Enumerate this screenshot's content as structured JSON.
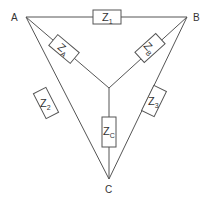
{
  "diagram": {
    "title": "",
    "type": "delta-star impedance network",
    "colors": {
      "line": "#555555",
      "text": "#333333",
      "background": "#ffffff"
    },
    "nodes": [
      {
        "id": "A",
        "label": "A"
      },
      {
        "id": "B",
        "label": "B"
      },
      {
        "id": "C",
        "label": "C"
      }
    ],
    "impedances": {
      "z1": {
        "main": "Z",
        "sub": "1",
        "between": "A-B",
        "network": "delta"
      },
      "z2": {
        "main": "Z",
        "sub": "2",
        "between": "A-C",
        "network": "delta"
      },
      "z3": {
        "main": "Z",
        "sub": "3",
        "between": "B-C",
        "network": "delta"
      },
      "za": {
        "main": "Z",
        "sub": "A",
        "between": "A-center",
        "network": "star"
      },
      "zb": {
        "main": "Z",
        "sub": "B",
        "between": "B-center",
        "network": "star"
      },
      "zc": {
        "main": "Z",
        "sub": "C",
        "between": "C-center",
        "network": "star"
      }
    }
  }
}
